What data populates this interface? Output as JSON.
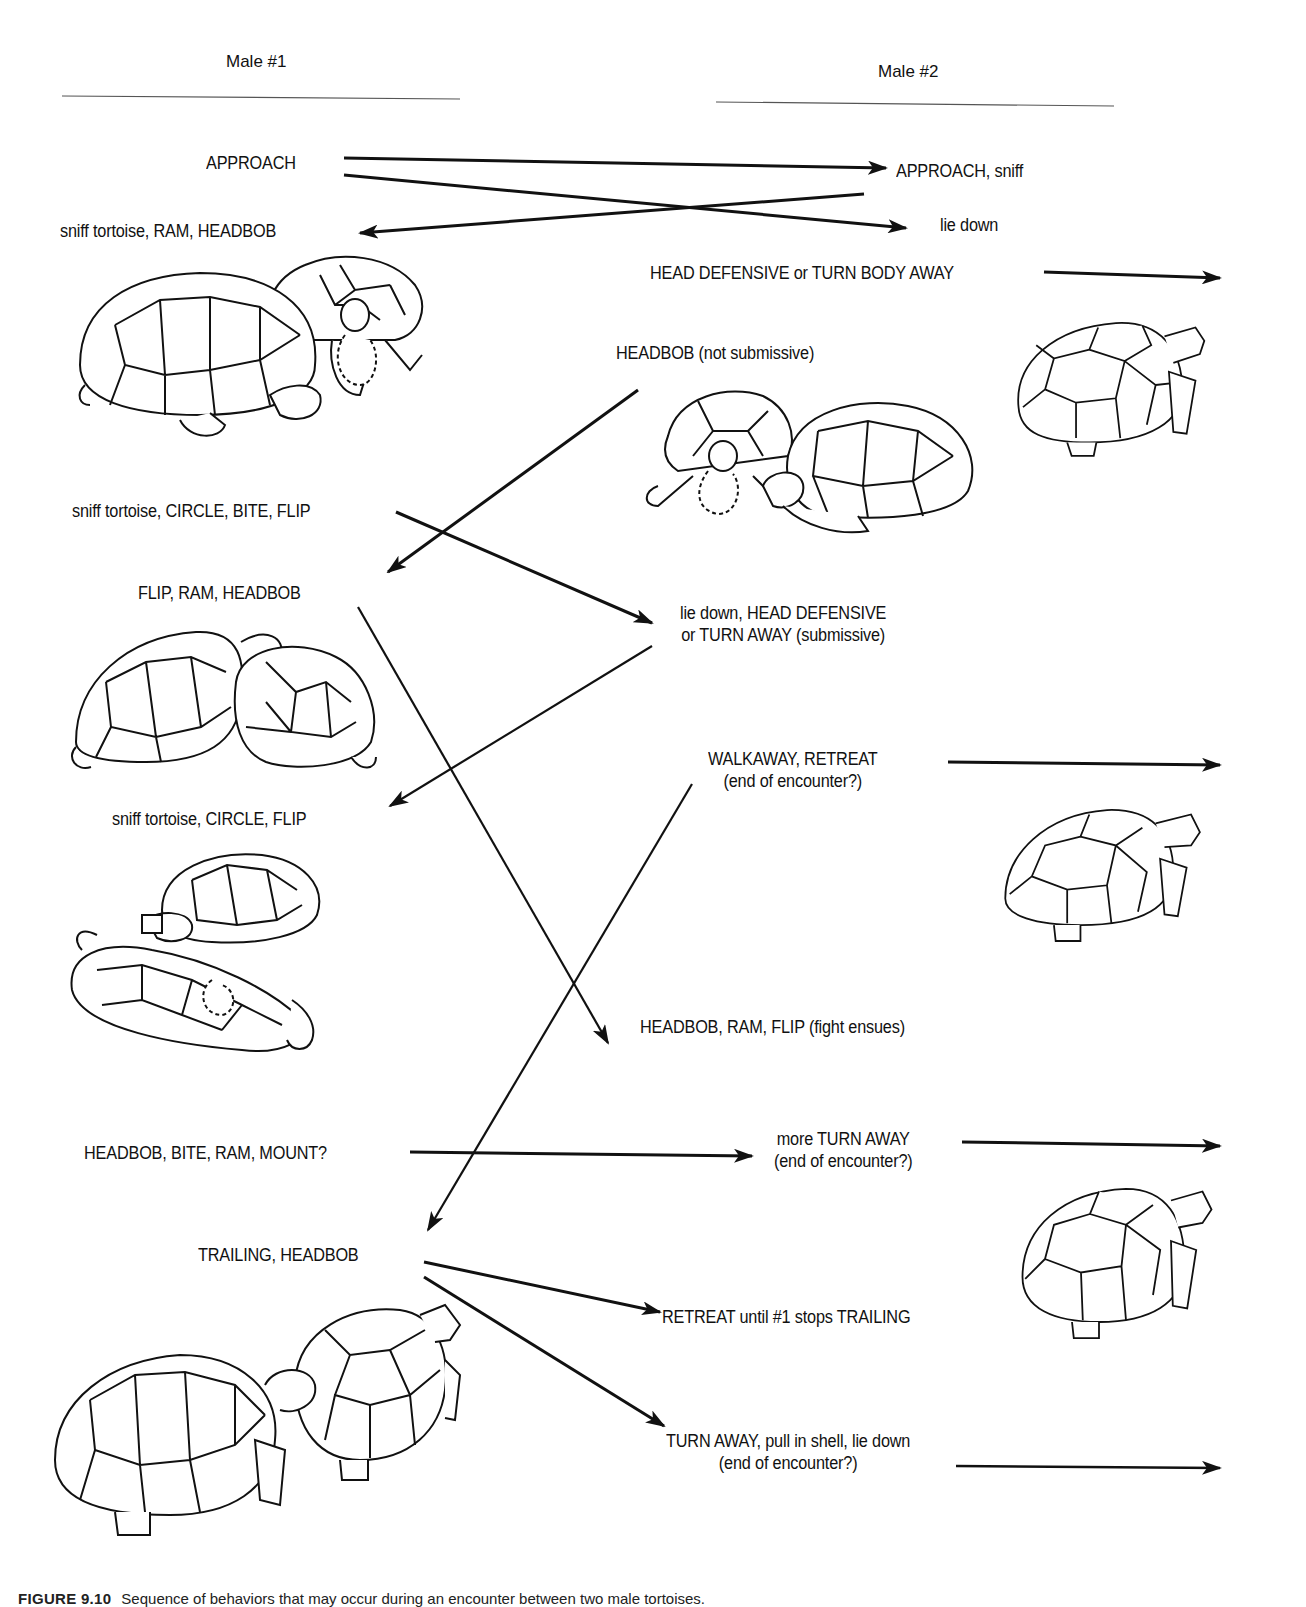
{
  "headers": {
    "male1": "Male #1",
    "male2": "Male #2"
  },
  "male1_behaviors": [
    "APPROACH",
    "sniff tortoise, RAM, HEADBOB",
    "sniff tortoise, CIRCLE, BITE, FLIP",
    "FLIP, RAM, HEADBOB",
    "sniff tortoise, CIRCLE, FLIP",
    "HEADBOB, BITE, RAM, MOUNT?",
    "TRAILING, HEADBOB"
  ],
  "male2_behaviors": [
    "APPROACH, sniff",
    "lie down",
    "HEAD DEFENSIVE or TURN BODY AWAY",
    "HEADBOB  (not submissive)",
    {
      "line1": "lie down, HEAD DEFENSIVE",
      "line2": "or TURN AWAY (submissive)"
    },
    {
      "line1": "WALKAWAY, RETREAT",
      "line2": "(end of encounter?)"
    },
    "HEADBOB, RAM, FLIP (fight ensues)",
    {
      "line1": "more TURN AWAY",
      "line2": "(end of encounter?)"
    },
    "RETREAT until #1 stops TRAILING",
    {
      "line1": "TURN AWAY, pull in shell, lie down",
      "line2": "(end of encounter?)"
    }
  ],
  "caption": {
    "figure_number": "FIGURE 9.10",
    "text": "Sequence of behaviors that may occur during an encounter between two male tortoises."
  },
  "illustrations": [
    "two-tortoises-headbob-ram",
    "tortoise-turn-away",
    "two-tortoises-headbob-not-submissive",
    "two-tortoises-flip",
    "tortoise-walkaway",
    "tortoise-flipped-circle",
    "tortoise-turn-away-2",
    "two-tortoises-trailing"
  ],
  "colors": {
    "ink": "#111111",
    "background": "#ffffff"
  }
}
